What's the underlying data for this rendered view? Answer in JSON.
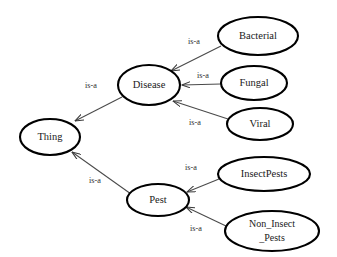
{
  "diagram": {
    "type": "ontology-taxonomy",
    "background_color": "#ffffff",
    "node_stroke_color": "#000000",
    "edge_stroke_color": "#4a4a4a",
    "text_color": "#1a1a1a",
    "nodes": [
      {
        "id": "thing",
        "label": "Thing",
        "cx": 50,
        "cy": 137,
        "rx": 30,
        "ry": 18,
        "lines": [
          "Thing"
        ]
      },
      {
        "id": "disease",
        "label": "Disease",
        "cx": 149,
        "cy": 85,
        "rx": 31,
        "ry": 20,
        "lines": [
          "Disease"
        ]
      },
      {
        "id": "pest",
        "label": "Pest",
        "cx": 158,
        "cy": 200,
        "rx": 31,
        "ry": 16,
        "lines": [
          "Pest"
        ]
      },
      {
        "id": "bacterial",
        "label": "Bacterial",
        "cx": 258,
        "cy": 36,
        "rx": 40,
        "ry": 19,
        "lines": [
          "Bacterial"
        ]
      },
      {
        "id": "fungal",
        "label": "Fungal",
        "cx": 254,
        "cy": 83,
        "rx": 33,
        "ry": 17,
        "lines": [
          "Fungal"
        ]
      },
      {
        "id": "viral",
        "label": "Viral",
        "cx": 260,
        "cy": 124,
        "rx": 33,
        "ry": 16,
        "lines": [
          "Viral"
        ]
      },
      {
        "id": "insectpests",
        "label": "InsectPests",
        "cx": 264,
        "cy": 174,
        "rx": 46,
        "ry": 17,
        "lines": [
          "InsectPests"
        ]
      },
      {
        "id": "non_insect_pests",
        "label": "Non_Insect _Pests",
        "cx": 272,
        "cy": 231,
        "rx": 47,
        "ry": 20,
        "lines": [
          "Non_Insect",
          "_Pests"
        ]
      }
    ],
    "edges": [
      {
        "id": "disease-thing",
        "label": "is-a",
        "from": "disease",
        "to": "thing",
        "x1": 122,
        "y1": 97,
        "x2": 75,
        "y2": 121,
        "lx": 91,
        "ly": 86
      },
      {
        "id": "pest-thing",
        "label": "is-a",
        "from": "pest",
        "to": "thing",
        "x1": 131,
        "y1": 194,
        "x2": 72,
        "y2": 152,
        "lx": 95,
        "ly": 181
      },
      {
        "id": "bacterial-disease",
        "label": "is-a",
        "from": "bacterial",
        "to": "disease",
        "x1": 221,
        "y1": 46,
        "x2": 171,
        "y2": 71,
        "lx": 194,
        "ly": 42
      },
      {
        "id": "fungal-disease",
        "label": "is-a",
        "from": "fungal",
        "to": "disease",
        "x1": 221,
        "y1": 84,
        "x2": 182,
        "y2": 85,
        "lx": 203,
        "ly": 76
      },
      {
        "id": "viral-disease",
        "label": "is-a",
        "from": "viral",
        "to": "disease",
        "x1": 228,
        "y1": 119,
        "x2": 173,
        "y2": 101,
        "lx": 195,
        "ly": 123
      },
      {
        "id": "insectpests-pest",
        "label": "is-a",
        "from": "insectpests",
        "to": "pest",
        "x1": 219,
        "y1": 179,
        "x2": 187,
        "y2": 192,
        "lx": 191,
        "ly": 168
      },
      {
        "id": "nonInsectPests-pest",
        "label": "is-a",
        "from": "non_insect_pests",
        "to": "pest",
        "x1": 226,
        "y1": 226,
        "x2": 186,
        "y2": 207,
        "lx": 196,
        "ly": 229
      }
    ]
  }
}
